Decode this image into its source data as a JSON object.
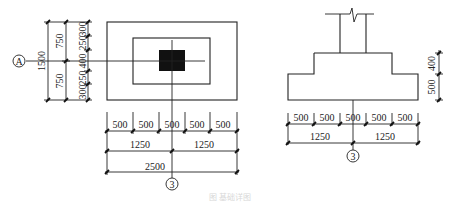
{
  "plan_view": {
    "axis_label_left": "A",
    "axis_label_bottom": "3",
    "left_dims": {
      "total": "1500",
      "halves": [
        "750",
        "750"
      ],
      "segments": [
        "300",
        "250",
        "400",
        "250",
        "300"
      ]
    },
    "bottom_dims": {
      "segments": [
        "500",
        "500",
        "500",
        "500",
        "500"
      ],
      "halves": [
        "1250",
        "1250"
      ],
      "total": "2500"
    }
  },
  "section_view": {
    "axis_label_bottom": "3",
    "right_dims": [
      "400",
      "500"
    ],
    "bottom_dims": {
      "segments": [
        "500",
        "500",
        "500",
        "500",
        "500"
      ],
      "halves": [
        "1250",
        "1250"
      ]
    }
  },
  "caption": "图  基础详图"
}
